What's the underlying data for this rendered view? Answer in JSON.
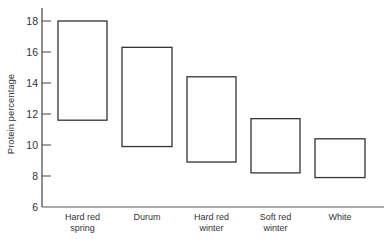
{
  "chart_data": {
    "type": "floating-bar",
    "title": "",
    "xlabel": "",
    "ylabel": "Protein percentage",
    "ylim": [
      6,
      18
    ],
    "yticks": [
      6,
      8,
      10,
      12,
      14,
      16,
      18
    ],
    "grid": false,
    "legend": null,
    "categories": [
      [
        "Hard red",
        "spring"
      ],
      [
        "Durum"
      ],
      [
        "Hard red",
        "winter"
      ],
      [
        "Soft red",
        "winter"
      ],
      [
        "White"
      ]
    ],
    "category_names": [
      "Hard red spring",
      "Durum",
      "Hard red winter",
      "Soft red winter",
      "White"
    ],
    "series": [
      {
        "name": "Protein range",
        "low": [
          11.6,
          9.9,
          8.9,
          8.2,
          7.9
        ],
        "high": [
          18.0,
          16.3,
          14.4,
          11.7,
          10.4
        ]
      }
    ]
  },
  "caption": ""
}
